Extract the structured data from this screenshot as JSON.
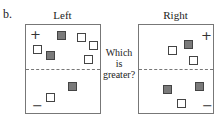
{
  "figure": {
    "part_label": "b.",
    "question": [
      "Which",
      "is",
      "greater?"
    ],
    "colors": {
      "filled": "#7a7a7a",
      "empty": "#ffffff",
      "border": "#444444",
      "divider": "#777777"
    },
    "panels": [
      {
        "label": "Left",
        "top_sign": "+",
        "bottom_sign": "−",
        "top_region": {
          "filled": 2,
          "empty": 4
        },
        "bottom_region": {
          "filled": 1,
          "empty": 1
        }
      },
      {
        "label": "Right",
        "top_sign": "+",
        "bottom_sign": "−",
        "top_region": {
          "filled": 1,
          "empty": 2
        },
        "bottom_region": {
          "filled": 2,
          "empty": 1
        }
      }
    ]
  }
}
